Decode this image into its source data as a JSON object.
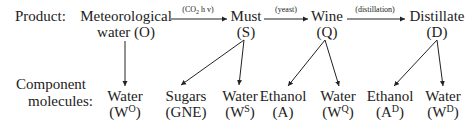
{
  "row_labels": {
    "product": "Product:",
    "component_line1": "Component",
    "component_line2": "molecules:"
  },
  "products": [
    {
      "name": "Meteorological",
      "name2": "water",
      "code": "(O)"
    },
    {
      "name": "Must",
      "code": "(S)"
    },
    {
      "name": "Wine",
      "code": "(Q)"
    },
    {
      "name": "Distillate",
      "code": "(D)"
    }
  ],
  "transitions": [
    {
      "from": "O",
      "to": "S",
      "label_pre": "(CO",
      "label_sub": "2",
      "label_post": " h v)"
    },
    {
      "from": "S",
      "to": "Q",
      "label": "(yeast)"
    },
    {
      "from": "Q",
      "to": "D",
      "label": "(distillation)"
    }
  ],
  "components": [
    {
      "name": "Water",
      "symbol": "W",
      "sup": "O",
      "parent": "O"
    },
    {
      "name": "Sugars",
      "symbol": "GNE",
      "sup": "",
      "parent": "S"
    },
    {
      "name": "Water",
      "symbol": "W",
      "sup": "S",
      "parent": "S"
    },
    {
      "name": "Ethanol",
      "symbol": "A",
      "sup": "",
      "parent": "Q"
    },
    {
      "name": "Water",
      "symbol": "W",
      "sup": "Q",
      "parent": "Q"
    },
    {
      "name": "Ethanol",
      "symbol": "A",
      "sup": "D",
      "parent": "D"
    },
    {
      "name": "Water",
      "symbol": "W",
      "sup": "D",
      "parent": "D"
    }
  ]
}
